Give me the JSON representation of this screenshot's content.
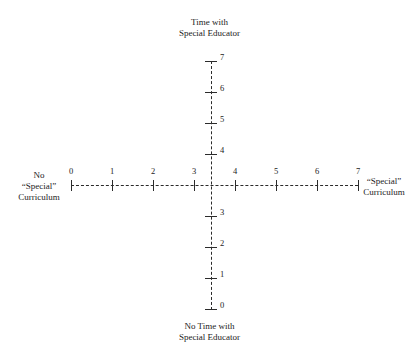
{
  "chart_data": {
    "type": "scatter",
    "title": "",
    "subtitle": "",
    "orientation": "cross-quadrant",
    "grid": false,
    "legend": null,
    "annotations": [],
    "axes": {
      "vertical": {
        "top_label": [
          "Time with",
          "Special Educator"
        ],
        "bottom_label": [
          "No Time with",
          "Special Educator"
        ],
        "ticks": [
          7,
          6,
          5,
          4,
          3,
          2,
          1,
          0
        ],
        "tick_labels": [
          "7",
          "6",
          "5",
          "4",
          "3",
          "2",
          "1",
          "0"
        ],
        "range": [
          0,
          7
        ],
        "style": "dashed"
      },
      "horizontal": {
        "left_label": [
          "No",
          "“Special”",
          "Curriculum"
        ],
        "right_label": [
          "“Special”",
          "Curriculum"
        ],
        "ticks": [
          0,
          1,
          2,
          3,
          4,
          5,
          6,
          7
        ],
        "tick_labels": [
          "0",
          "1",
          "2",
          "3",
          "4",
          "5",
          "6",
          "7"
        ],
        "range": [
          0,
          7
        ],
        "style": "dashed"
      }
    },
    "series": [],
    "values": [],
    "categories": [],
    "xlabel": "“Special” Curriculum",
    "ylabel": "Time with Special Educator",
    "xlim": [
      0,
      7
    ],
    "ylim": [
      0,
      7
    ],
    "colors": {
      "background": "#ffffff",
      "axis": "#2b2b2b",
      "text": "#232323"
    }
  },
  "labels": {
    "top": {
      "line1": "Time with",
      "line2": "Special Educator"
    },
    "bottom": {
      "line1": "No Time with",
      "line2": "Special Educator"
    },
    "left": {
      "line1": "No",
      "line2": "“Special”",
      "line3": "Curriculum"
    },
    "right": {
      "line1": "“Special”",
      "line2": "Curriculum"
    }
  },
  "h_ticks": [
    {
      "label": "0",
      "x": 71
    },
    {
      "label": "1",
      "x": 112
    },
    {
      "label": "2",
      "x": 153
    },
    {
      "label": "3",
      "x": 194
    },
    {
      "label": "4",
      "x": 235
    },
    {
      "label": "5",
      "x": 276
    },
    {
      "label": "6",
      "x": 317
    },
    {
      "label": "7",
      "x": 358
    }
  ],
  "v_ticks": [
    {
      "label": "7",
      "y": 61
    },
    {
      "label": "6",
      "y": 92
    },
    {
      "label": "5",
      "y": 123
    },
    {
      "label": "4",
      "y": 154
    },
    {
      "label": "3",
      "y": 216
    },
    {
      "label": "2",
      "y": 247
    },
    {
      "label": "1",
      "y": 278
    },
    {
      "label": "0",
      "y": 309
    }
  ]
}
